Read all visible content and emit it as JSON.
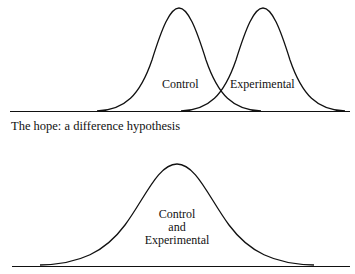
{
  "top_panel": {
    "labels": {
      "control": "Control",
      "experimental": "Experimental"
    },
    "caption": "The hope: a difference hypothesis"
  },
  "bottom_panel": {
    "label_lines": [
      "Control",
      "and",
      "Experimental"
    ]
  },
  "colors": {
    "line": "#111111",
    "background": "#ffffff"
  }
}
